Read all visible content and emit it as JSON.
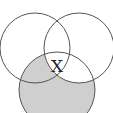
{
  "diagram": {
    "type": "venn-3",
    "circles": [
      {
        "id": "left",
        "cx": 35,
        "cy": 48,
        "r": 35
      },
      {
        "id": "right",
        "cx": 79,
        "cy": 48,
        "r": 35
      },
      {
        "id": "bottom",
        "cx": 57,
        "cy": 90,
        "r": 38
      }
    ],
    "shaded_region": "bottom minus right",
    "label": "X",
    "label_position": {
      "x": 57,
      "y": 66
    },
    "colors": {
      "stroke": "#555555",
      "shade": "#cfcfcf",
      "background": "#ffffff"
    }
  }
}
